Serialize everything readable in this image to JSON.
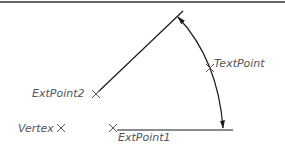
{
  "diagram": {
    "type": "angular-dimension",
    "colors": {
      "line": "#1a1a1a",
      "marker": "#555555",
      "label": "#555555",
      "border": "#333333"
    },
    "points": [
      {
        "id": "vertex",
        "label": "Vertex",
        "x": 61,
        "y": 128
      },
      {
        "id": "extpoint1",
        "label": "ExtPoint1",
        "x": 113,
        "y": 128
      },
      {
        "id": "extpoint2",
        "label": "ExtPoint2",
        "x": 96,
        "y": 94
      },
      {
        "id": "textpoint",
        "label": "TextPoint",
        "x": 210,
        "y": 68
      }
    ],
    "labels": {
      "vertex": "Vertex",
      "extpoint1": "ExtPoint1",
      "extpoint2": "ExtPoint2",
      "textpoint": "TextPoint"
    }
  }
}
